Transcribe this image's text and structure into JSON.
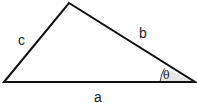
{
  "diagram": {
    "type": "triangle",
    "vertices": {
      "left": [
        4,
        82
      ],
      "top": [
        69,
        3
      ],
      "right": [
        195,
        82
      ]
    },
    "sides": {
      "a": {
        "label": "a",
        "between": [
          "left",
          "right"
        ]
      },
      "b": {
        "label": "b",
        "between": [
          "top",
          "right"
        ]
      },
      "c": {
        "label": "c",
        "between": [
          "left",
          "top"
        ]
      }
    },
    "angle": {
      "label": "θ",
      "vertex": "right",
      "fill": "#e8e8e8"
    },
    "stroke_color": "#111111"
  }
}
